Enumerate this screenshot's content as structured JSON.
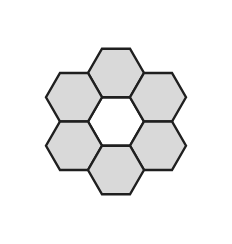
{
  "figure": {
    "name": "hexagon-rosette",
    "title": "Hexagon rosette of six flat-top hexagons around an empty center",
    "canvas": {
      "width": 232,
      "height": 244,
      "background_color": "#ffffff"
    },
    "style": {
      "fill_color": "#d9d9d9",
      "stroke_color": "#1f1f1f",
      "stroke_width": 2.4,
      "center_fill_color": "#ffffff",
      "orientation": "flat-top"
    },
    "geometry": {
      "center_x": 116,
      "center_y": 121.5,
      "circumradius": 28,
      "apothem": 24.25,
      "ring_offset_x": 42,
      "ring_offset_y": 24.25,
      "cell_count": 7,
      "filled_cell_count": 6,
      "empty_cell_count": 1
    },
    "cells": [
      {
        "name": "hex-center",
        "position_label": "center",
        "cx": 116,
        "cy": 121.5,
        "filled": false,
        "fill": "#ffffff"
      },
      {
        "name": "hex-top",
        "position_label": "top",
        "cx": 116,
        "cy": 73,
        "filled": true,
        "fill": "#d9d9d9"
      },
      {
        "name": "hex-upper-left",
        "position_label": "upper-left",
        "cx": 74,
        "cy": 97.25,
        "filled": true,
        "fill": "#d9d9d9"
      },
      {
        "name": "hex-upper-right",
        "position_label": "upper-right",
        "cx": 158,
        "cy": 97.25,
        "filled": true,
        "fill": "#d9d9d9"
      },
      {
        "name": "hex-lower-left",
        "position_label": "lower-left",
        "cx": 74,
        "cy": 145.75,
        "filled": true,
        "fill": "#d9d9d9"
      },
      {
        "name": "hex-lower-right",
        "position_label": "lower-right",
        "cx": 158,
        "cy": 145.75,
        "filled": true,
        "fill": "#d9d9d9"
      },
      {
        "name": "hex-bottom",
        "position_label": "bottom",
        "cx": 116,
        "cy": 170,
        "filled": true,
        "fill": "#d9d9d9"
      }
    ]
  }
}
